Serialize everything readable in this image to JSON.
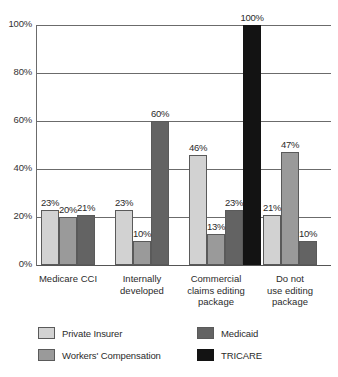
{
  "chart_data": {
    "type": "bar",
    "title": "",
    "xlabel": "",
    "ylabel": "",
    "ylim": [
      0,
      100
    ],
    "grid": true,
    "legend_position": "bottom",
    "categories": [
      "Medicare CCI",
      "Internally developed",
      "Commercial claims editing package",
      "Do not use editing package"
    ],
    "category_lines": [
      "Medicare CCI",
      "Internally\ndeveloped",
      "Commercial\nclaims editing\npackage",
      "Do not\nuse editing\npackage"
    ],
    "ytick_labels": [
      "0%",
      "20%",
      "40%",
      "60%",
      "80%",
      "100%"
    ],
    "ytick_values": [
      0,
      20,
      40,
      60,
      80,
      100
    ],
    "series": [
      {
        "name": "Private Insurer",
        "color": "#d2d2d2",
        "values": [
          23,
          23,
          46,
          21
        ],
        "value_labels": [
          "23%",
          "23%",
          "46%",
          "21%"
        ]
      },
      {
        "name": "Workers' Compensation",
        "color": "#9a9a9a",
        "values": [
          20,
          10,
          13,
          47
        ],
        "value_labels": [
          "20%",
          "10%",
          "13%",
          "47%"
        ]
      },
      {
        "name": "Medicaid",
        "color": "#636363",
        "values": [
          21,
          60,
          23,
          10
        ],
        "value_labels": [
          "21%",
          "60%",
          "23%",
          "10%"
        ]
      },
      {
        "name": "TRICARE",
        "color": "#131313",
        "values": [
          null,
          null,
          100,
          null
        ],
        "value_labels": [
          "",
          "",
          "100%",
          ""
        ]
      }
    ],
    "legend_entries": [
      {
        "label": "Private Insurer",
        "color": "#d2d2d2"
      },
      {
        "label": "Medicaid",
        "color": "#636363"
      },
      {
        "label": "Workers' Compensation",
        "color": "#9a9a9a"
      },
      {
        "label": "TRICARE",
        "color": "#131313"
      }
    ]
  }
}
